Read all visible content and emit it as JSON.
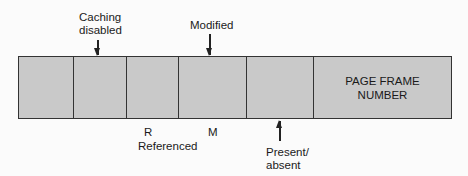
{
  "diagram": {
    "type": "page-table-entry",
    "fields": [
      {
        "id": "unused",
        "label": ""
      },
      {
        "id": "caching-disabled",
        "label": ""
      },
      {
        "id": "referenced",
        "label": ""
      },
      {
        "id": "modified",
        "label": ""
      },
      {
        "id": "protection",
        "label": ""
      },
      {
        "id": "page-frame-number",
        "label": "PAGE FRAME NUMBER",
        "line1": "PAGE FRAME",
        "line2": "NUMBER"
      }
    ],
    "annotations": {
      "caching_disabled": {
        "line1": "Caching",
        "line2": "disabled"
      },
      "modified": {
        "text": "Modified"
      },
      "r_bit": {
        "text": "R"
      },
      "m_bit": {
        "text": "M"
      },
      "referenced": {
        "text": "Referenced"
      },
      "present_absent": {
        "line1": "Present/",
        "line2": "absent"
      }
    },
    "colors": {
      "field_fill": "#c9c9c9",
      "border": "#333333",
      "background": "#fbfbfb",
      "text": "#1a1a1a"
    }
  }
}
